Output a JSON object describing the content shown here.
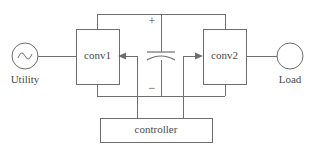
{
  "diagram": {
    "line_color": "#6e6e70",
    "text_color": "#4a4a4c",
    "background": "#ffffff",
    "source": {
      "label": "Utility",
      "symbol": "ac-source-sine"
    },
    "load": {
      "label": "Load",
      "symbol": "circle"
    },
    "blocks": [
      {
        "id": "conv1",
        "label": "conv1"
      },
      {
        "id": "conv2",
        "label": "conv2"
      },
      {
        "id": "controller",
        "label": "controller"
      }
    ],
    "dc_link": {
      "component": "capacitor",
      "plus_label": "+",
      "minus_label": "−"
    }
  }
}
